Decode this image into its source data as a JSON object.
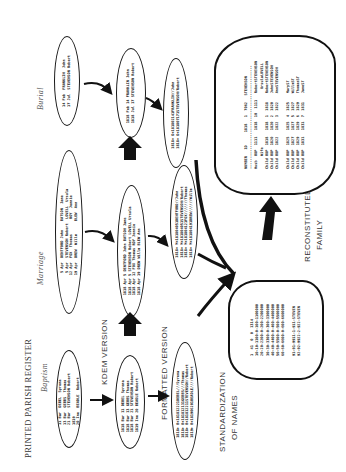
{
  "figure": {
    "orientation": "rotated-90-ccw",
    "labels": {
      "printed_register": "PRINTED PARISH REGISTER",
      "baptism": "Baptism",
      "marriage": "Marriage",
      "burial": "Burial",
      "kdem_version": "KDEM VERSION",
      "formatted_version": "FORMATTED VERSION",
      "standardization": "STANDARDIZATION",
      "of_names": "OF NAMES",
      "reconstituted": "RECONSTITUTED",
      "family": "FAMILY"
    },
    "register_entries": {
      "baptism": "11 Bar  DEBEL  Syrena\n13 Bar  GEBBS  Thomas\n21 Bar  STEVENSON Robert\n1819\n20 Ine  BEADLE  Robert",
      "marriage": " 5 Apr  DENTFORD John    BATSON  Jane\n 5 Apr  STEVENSON Robert  LOVELL  Ursula\n12 Apr  FOX  Thomas       ROY  Jennie\n19 Apr  DREW  Willm      BLEW  Ann",
      "burial": "14 Feb  FRANKLIN  John\n17 Jul  STEVENSON Robert"
    },
    "kdem_entries": {
      "baptism": "1818 Bar 11 DEBEL Syrena\n1818 Bar 13 GEBBS Thomas\n1818 Bar 21 STEVENSON Robert\n1819 Ine 20 BEADLE Robert",
      "marriage": "1818 Apr 5 DENTFORD John BATSON Jane\n1818 Apr 5 STEVENSON Robert LOVELL Ursula\n1818 Apr 12 FOX Thomas ROY Jennie\n1818 Apr 19 DREW Willm BLEW Ann",
      "burial": "1818 Feb 14 FRANKLIN John\n1818 Jul 17 STEVENSON Robert"
    },
    "formatted_entries": {
      "baptism": "1818+ B+181812221DEBEL///Syrena\n1818+ B+181812131GEBBS///Thomas\n1818+ B+181812211STEVENSON//Robert\n1819+ B+181906201BEADLE////Robert",
      "marriage": "1818+ M+181804051DENTFORD//John\n1818+ M+181804051STEVENSON/Robert\n1818+ M+181804121FOX///////Thomas\n1818+ M+181804191DREW//////Willm",
      "burial": "1818+ D+181802141FRANKLIN//John\n1818+ D+181807171STEVENSON/Robert"
    },
    "standardization_table": "1  41  0  0  1314\n10-10-1100-0-100-1100000\n20-20-2200-0-200-2200000\n30-30-3300-0-300-3300000\n40-40-4400-0-400-4400000\n50-50-5500-0-500-5500000\n60-60-6600-0-600-6600000\n\n91-91-9911-1-911-STEVEN\n92-92-9922-2-922-STEVEN",
    "family_table": "NUMBER   1D      1818   1  7062   STEVENSON\n------------------------------------------------\nHusb  B8P  1111   1818  10  1111   RobertSTEVENSON\n      Wife                           UrsulaLOVELL\nChild B8P  1818   1818  1  1818    RobertSTEVENSON\nChild B8P  1820   1820  2  1820    JohnSTEVENSON\nChild B8P  1822   1822  3  1822    AnnSTEVENSON\n\nChild B8P  1825   1825  4  1825    MaryST\nChild B8P  1827   1827  5  1827    WillmST\nChild B8P  1829   1829  6  1829    ThomasST\nChild B8P  1831   1831  7  1831    JaneST"
  }
}
